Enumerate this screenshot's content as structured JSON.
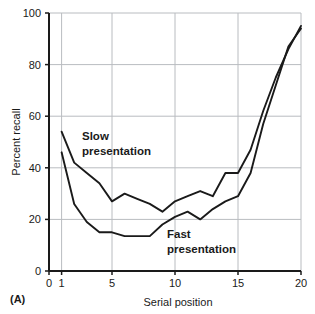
{
  "panel": {
    "label": "(A)"
  },
  "chart_data": {
    "type": "line",
    "title": "",
    "xlabel": "Serial position",
    "ylabel": "Percent recall",
    "xlim": [
      0,
      20
    ],
    "ylim": [
      0,
      100
    ],
    "xticks": [
      0,
      1,
      5,
      10,
      15,
      20
    ],
    "yticks": [
      0,
      20,
      40,
      60,
      80,
      100
    ],
    "grid": true,
    "grid_color": "#b9bcc0",
    "line_color": "#1a1a1a",
    "legend": "inline-annotations",
    "x": [
      1,
      2,
      3,
      4,
      5,
      6,
      7,
      8,
      9,
      10,
      11,
      12,
      13,
      14,
      15,
      16,
      17,
      18,
      19,
      20
    ],
    "series": [
      {
        "name": "Slow presentation",
        "values": [
          54,
          42,
          38,
          34,
          27,
          30,
          28,
          26,
          23,
          27,
          29,
          31,
          29,
          38,
          38,
          47,
          62,
          75,
          86,
          95
        ]
      },
      {
        "name": "Fast presentation",
        "values": [
          46,
          26,
          19,
          15,
          15,
          13.5,
          13.5,
          13.5,
          18,
          21,
          23,
          20,
          24,
          27,
          29,
          38,
          57,
          72,
          87,
          94
        ]
      }
    ],
    "annotations": [
      {
        "text_line1": "Slow",
        "text_line2": "presentation",
        "for_series": "Slow presentation"
      },
      {
        "text_line1": "Fast",
        "text_line2": "presentation",
        "for_series": "Fast presentation"
      }
    ]
  }
}
